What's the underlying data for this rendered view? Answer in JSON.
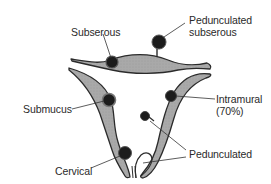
{
  "diagram": {
    "type": "anatomical-diagram",
    "colors": {
      "tissue_fill": "#a9a9a9",
      "outline": "#2b2b2b",
      "fibroid": "#1c1c1c",
      "leader_line": "#333333",
      "background": "#ffffff"
    },
    "labels": {
      "subserous": "Subserous",
      "pedunculated_subserous": [
        "Pedunculated",
        "subserous"
      ],
      "submucus": "Submucus",
      "intramural": [
        "Intramural",
        "(70%)"
      ],
      "pedunculated": "Pedunculated",
      "cervical": "Cervical"
    }
  }
}
